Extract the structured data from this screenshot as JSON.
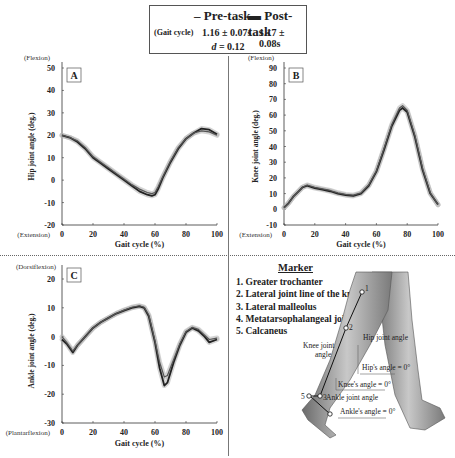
{
  "legend": {
    "pre_label": "Pre-task",
    "post_label": "Post-task",
    "gait_cycle_label": "(Gait cycle)",
    "pre_value": "1.16 ± 0.07s",
    "post_value": "1.17 ± 0.08s",
    "effect_prefix": "d",
    "effect_value": "= 0.12"
  },
  "chart_data": [
    {
      "panel": "A",
      "type": "line",
      "title": "",
      "xlabel": "Gait cycle (%)",
      "ylabel": "Hip joint angle (deg.)",
      "top_note": "(Flexion)",
      "bottom_note": "(Extension)",
      "xlim": [
        0,
        100
      ],
      "ylim": [
        -20,
        50
      ],
      "xticks": [
        0,
        20,
        40,
        60,
        80,
        100
      ],
      "yticks": [
        -20,
        -10,
        0,
        10,
        20,
        30,
        40,
        50
      ],
      "x": [
        0,
        5,
        10,
        15,
        20,
        25,
        30,
        35,
        40,
        45,
        50,
        55,
        58,
        60,
        62,
        65,
        70,
        75,
        80,
        85,
        90,
        95,
        100
      ],
      "series": [
        {
          "name": "Pre-task",
          "values": [
            20,
            19,
            17,
            14,
            10,
            7.5,
            5,
            2.5,
            0,
            -2.5,
            -5,
            -6.5,
            -7,
            -6.5,
            -4,
            1,
            8,
            14,
            18.5,
            21,
            23,
            22.5,
            20.5
          ]
        },
        {
          "name": "Post-task",
          "values": [
            20,
            19,
            17.5,
            14.5,
            10.5,
            8,
            5.5,
            3,
            0.5,
            -2,
            -4,
            -5.5,
            -6,
            -5.5,
            -3,
            1.5,
            8.5,
            14.5,
            18.5,
            21,
            22,
            21.5,
            20
          ]
        }
      ]
    },
    {
      "panel": "B",
      "type": "line",
      "title": "",
      "xlabel": "Gait cycle (%)",
      "ylabel": "Knee joint angle (deg.)",
      "top_note": "(Flexion)",
      "bottom_note": "(Extension)",
      "xlim": [
        0,
        100
      ],
      "ylim": [
        -10,
        90
      ],
      "xticks": [
        0,
        20,
        40,
        60,
        80,
        100
      ],
      "yticks": [
        -10,
        0,
        10,
        20,
        30,
        40,
        50,
        60,
        70,
        80,
        90
      ],
      "x": [
        0,
        3,
        6,
        9,
        12,
        15,
        20,
        25,
        30,
        35,
        40,
        45,
        50,
        55,
        60,
        65,
        70,
        75,
        77,
        80,
        85,
        90,
        95,
        100
      ],
      "series": [
        {
          "name": "Pre-task",
          "values": [
            1,
            4,
            8,
            11,
            14,
            15,
            13.5,
            12.5,
            11.5,
            10,
            9,
            8.5,
            10,
            15,
            24,
            38,
            53,
            63,
            64.5,
            62,
            46,
            25,
            10,
            3
          ]
        },
        {
          "name": "Post-task",
          "values": [
            1,
            4,
            8,
            11,
            14,
            15.5,
            14,
            13,
            12,
            10.5,
            9.5,
            9,
            10.5,
            15.5,
            24.5,
            39,
            54,
            64.5,
            66,
            63,
            47,
            26,
            10.5,
            3
          ]
        }
      ]
    },
    {
      "panel": "C",
      "type": "line",
      "title": "",
      "xlabel": "Gait cycle (%)",
      "ylabel": "Ankle joint angle (deg.)",
      "top_note": "(Dorsiflexion)",
      "bottom_note": "(Plantarflexion)",
      "xlim": [
        0,
        100
      ],
      "ylim": [
        -30,
        25
      ],
      "xticks": [
        0,
        20,
        40,
        60,
        80,
        100
      ],
      "yticks": [
        -30,
        -20,
        -10,
        0,
        10,
        20
      ],
      "x": [
        0,
        3,
        7,
        10,
        15,
        20,
        25,
        30,
        35,
        40,
        45,
        50,
        53,
        56,
        60,
        63,
        66,
        68,
        72,
        76,
        80,
        84,
        88,
        92,
        95,
        100
      ],
      "series": [
        {
          "name": "Pre-task",
          "values": [
            -1,
            -2.5,
            -5.5,
            -3,
            0,
            3,
            5,
            6.5,
            8,
            9,
            10,
            10.5,
            10,
            7,
            -2,
            -11,
            -17,
            -16,
            -9,
            -3,
            1.5,
            3,
            2,
            0,
            -2,
            -1
          ]
        },
        {
          "name": "Post-task",
          "values": [
            0,
            -2,
            -5,
            -3,
            0,
            3,
            5,
            6.5,
            8,
            9.2,
            10.2,
            10.7,
            10.2,
            7.5,
            -1.5,
            -9,
            -14,
            -13.5,
            -8,
            -2.5,
            1.8,
            3.2,
            2.5,
            0.5,
            -1,
            -0.5
          ]
        }
      ]
    }
  ],
  "marker": {
    "title": "Marker",
    "items": [
      "1. Greater trochanter",
      "2. Lateral joint line of the knee",
      "3. Lateral malleolus",
      "4. Metatarsophalangeal joint",
      "5. Calcaneus"
    ]
  },
  "leg_figure": {
    "labels": {
      "hip_joint_angle": "Hip joint angle",
      "knee_joint_angle_1": "Knee joint",
      "knee_joint_angle_2": "angle",
      "ankle_joint_angle": "Ankle joint angle",
      "hips_angle_zero": "Hip's angle = 0°",
      "knees_angle_zero": "Knee's angle = 0°",
      "ankles_angle_zero": "Ankle's angle = 0°"
    },
    "marker_numbers": [
      "1",
      "2",
      "3",
      "4",
      "5"
    ]
  },
  "colors": {
    "pre": "#222222",
    "post": "#555555",
    "band": "#b0b0b0"
  }
}
